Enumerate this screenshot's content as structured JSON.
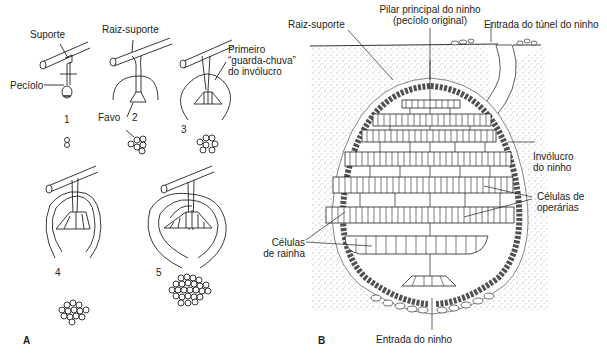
{
  "panel_a": {
    "letter": "A",
    "labels": {
      "suporte": "Suporte",
      "peciolo": "Pecíolo",
      "raiz_suporte": "Raiz-suporte",
      "favo": "Favo",
      "primeiro_1": "Primeiro",
      "primeiro_2": "“guarda-chuva”",
      "primeiro_3": "do invólucro"
    },
    "stages": [
      "1",
      "2",
      "3",
      "4",
      "5"
    ]
  },
  "panel_b": {
    "letter": "B",
    "labels": {
      "raiz_suporte": "Raiz-suporte",
      "pilar_1": "Pilar principal do ninho",
      "pilar_2": "(pecíolo original)",
      "entrada_tunel": "Entrada do túnel do ninho",
      "involucro_1": "Invólucro",
      "involucro_2": "do ninho",
      "operarias_1": "Células de",
      "operarias_2": "operárias",
      "rainha_1": "Células",
      "rainha_2": "de rainha",
      "entrada_ninho": "Entrada do ninho"
    }
  }
}
